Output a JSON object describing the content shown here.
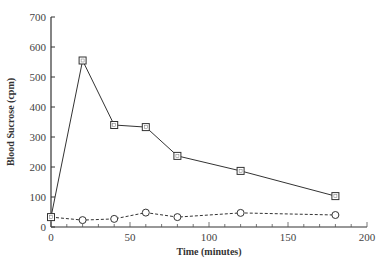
{
  "chart_data": {
    "type": "line",
    "title": "",
    "xlabel": "Time (minutes)",
    "ylabel": "Blood Sucrose (cpm)",
    "xlim": [
      0,
      200
    ],
    "ylim": [
      0,
      700
    ],
    "xticks": [
      0,
      50,
      100,
      150,
      200
    ],
    "yticks": [
      0,
      100,
      200,
      300,
      400,
      500,
      600,
      700
    ],
    "grid": false,
    "legend": null,
    "series": [
      {
        "name": "squares (solid line)",
        "marker": "square",
        "line_style": "solid",
        "x": [
          0,
          20,
          40,
          60,
          80,
          120,
          180
        ],
        "values": [
          33,
          555,
          340,
          333,
          237,
          187,
          103
        ]
      },
      {
        "name": "circles (dashed line)",
        "marker": "circle",
        "line_style": "dashed",
        "x": [
          0,
          20,
          40,
          60,
          80,
          120,
          180
        ],
        "values": [
          33,
          23,
          27,
          48,
          33,
          47,
          40
        ]
      }
    ]
  }
}
